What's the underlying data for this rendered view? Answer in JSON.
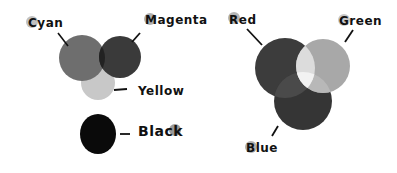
{
  "diagram": {
    "cmyk": {
      "title": "subtractive",
      "labels": {
        "cyan": "Cyan",
        "magenta": "Magenta",
        "yellow": "Yellow",
        "black": "Black"
      },
      "colors": {
        "cyan": "#6e6e6e",
        "magenta": "#3a3a3a",
        "overlap_cm": "#222222",
        "yellow": "#c8c8c8",
        "black": "#0a0a0a",
        "label_dot": "#b5b5b5"
      }
    },
    "rgb": {
      "title": "additive",
      "labels": {
        "red": "Red",
        "green": "Green",
        "blue": "Blue"
      },
      "colors": {
        "red": "#3c3c3c",
        "green": "#a8a8a8",
        "blue": "#353535",
        "overlap_rg": "#dcdcdc",
        "overlap_gb": "#b8b8b8",
        "overlap_rb": "#4a4a4a",
        "center": "#f2f2f2",
        "label_dot": "#b5b5b5"
      }
    }
  }
}
